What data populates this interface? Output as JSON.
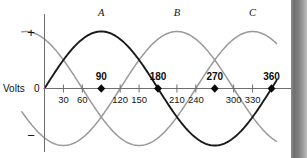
{
  "chart_data": {
    "type": "line",
    "title": "",
    "xlabel": "",
    "ylabel": "Volts",
    "x": [
      0,
      30,
      60,
      90,
      120,
      150,
      180,
      210,
      240,
      270,
      300,
      330,
      360
    ],
    "xlim": [
      0,
      360
    ],
    "ylim": [
      -1,
      1
    ],
    "grid": false,
    "legend_position": "above-curve-peaks",
    "series": [
      {
        "name": "A",
        "color": "#1a1a1a",
        "phase_deg": 0,
        "peak_deg": 90,
        "zero_crossings_deg": [
          0,
          180,
          360
        ],
        "values": [
          0,
          0.5,
          0.866,
          1,
          0.866,
          0.5,
          0,
          -0.5,
          -0.866,
          -1,
          -0.866,
          -0.5,
          0
        ]
      },
      {
        "name": "B",
        "color": "#9a9a9a",
        "phase_deg": 120,
        "peak_deg": 210,
        "zero_crossings_deg": [
          120,
          300
        ],
        "values": [
          -0.866,
          -1,
          -0.866,
          -0.5,
          0,
          0.5,
          0.866,
          1,
          0.866,
          0.5,
          0,
          -0.5,
          -0.866
        ]
      },
      {
        "name": "C",
        "color": "#9a9a9a",
        "phase_deg": 240,
        "peak_deg": 330,
        "zero_crossings_deg": [
          60,
          240
        ],
        "values": [
          0.866,
          0.5,
          0,
          -0.5,
          -0.866,
          -1,
          -0.866,
          -0.5,
          0,
          0.5,
          0.866,
          1,
          0.866
        ]
      }
    ],
    "minor_ticks": [
      30,
      60,
      120,
      150,
      210,
      240,
      300,
      330
    ],
    "marked_points": [
      90,
      180,
      270,
      360
    ],
    "y_axis_ticks": [
      "+",
      "0",
      "−"
    ]
  },
  "axis": {
    "y_label": "Volts",
    "y_plus": "+",
    "y_zero": "0",
    "y_minus": "−"
  },
  "ticks": {
    "minor": [
      {
        "label": "30",
        "deg": 30
      },
      {
        "label": "60",
        "deg": 60
      },
      {
        "label": "120",
        "deg": 120
      },
      {
        "label": "150",
        "deg": 150
      },
      {
        "label": "210",
        "deg": 210
      },
      {
        "label": "240",
        "deg": 240
      },
      {
        "label": "300",
        "deg": 300
      },
      {
        "label": "330",
        "deg": 330
      }
    ],
    "major": [
      {
        "label": "90",
        "deg": 90
      },
      {
        "label": "180",
        "deg": 180
      },
      {
        "label": "270",
        "deg": 270
      },
      {
        "label": "360",
        "deg": 360
      }
    ]
  },
  "curve_labels": [
    {
      "name": "A",
      "x": 90
    },
    {
      "name": "B",
      "x": 210
    },
    {
      "name": "C",
      "x": 330
    }
  ]
}
